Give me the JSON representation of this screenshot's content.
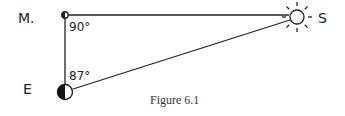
{
  "diagram": {
    "labels": {
      "moon": "M.",
      "earth": "E",
      "sun": "S"
    },
    "angles": {
      "at_moon": "90°",
      "at_earth": "87°"
    },
    "caption": "Figure 6.1",
    "colors": {
      "line": "#222222",
      "background": "#ffffff"
    }
  }
}
